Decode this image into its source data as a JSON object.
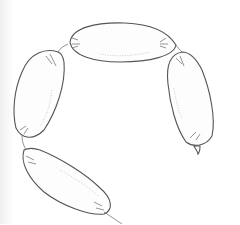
{
  "image": {
    "subject": "line drawing of a chain of four linked sausages",
    "background_color": "#ffffff",
    "line_color": "#555555",
    "links": [
      {
        "name": "top",
        "position": "top center, horizontal"
      },
      {
        "name": "left",
        "position": "left, vertical"
      },
      {
        "name": "right",
        "position": "right, vertical, hanging end with tail"
      },
      {
        "name": "bottom",
        "position": "bottom left, diagonal"
      }
    ]
  }
}
